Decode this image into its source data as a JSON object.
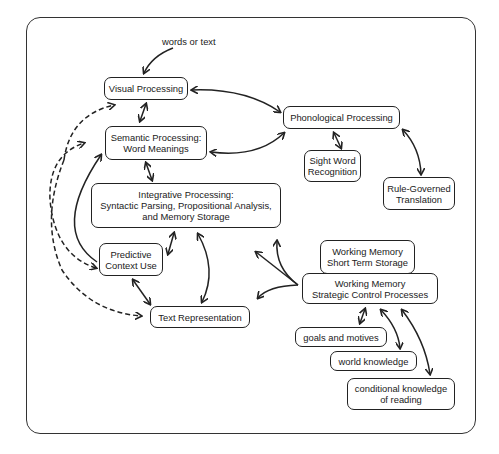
{
  "diagram": {
    "type": "reading-process-model",
    "input_label": "words or text",
    "nodes": {
      "visual": {
        "lines": [
          "Visual Processing"
        ]
      },
      "semantic": {
        "lines": [
          "Semantic Processing:",
          "Word Meanings"
        ]
      },
      "phonological": {
        "lines": [
          "Phonological Processing"
        ]
      },
      "sight_word": {
        "lines": [
          "Sight Word",
          "Recognition"
        ]
      },
      "rule_governed": {
        "lines": [
          "Rule-Governed",
          "Translation"
        ]
      },
      "integrative": {
        "lines": [
          "Integrative Processing:",
          "Syntactic Parsing, Propositional Analysis,",
          "and Memory Storage"
        ]
      },
      "predictive": {
        "lines": [
          "Predictive",
          "Context Use"
        ]
      },
      "text_rep": {
        "lines": [
          "Text Representation"
        ]
      },
      "wm_short": {
        "lines": [
          "Working Memory",
          "Short Term Storage"
        ]
      },
      "wm_strategic": {
        "lines": [
          "Working Memory",
          "Strategic Control Processes"
        ]
      },
      "goals": {
        "lines": [
          "goals and motives"
        ]
      },
      "world": {
        "lines": [
          "world knowledge"
        ]
      },
      "conditional": {
        "lines": [
          "conditional knowledge",
          "of reading"
        ]
      }
    },
    "edges": [
      {
        "from": "input",
        "to": "visual",
        "style": "solid",
        "direction": "one-way"
      },
      {
        "from": "visual",
        "to": "semantic",
        "style": "solid",
        "direction": "two-way"
      },
      {
        "from": "phonological",
        "to": "visual",
        "style": "solid",
        "direction": "two-way"
      },
      {
        "from": "phonological",
        "to": "semantic",
        "style": "solid",
        "direction": "two-way"
      },
      {
        "from": "phonological",
        "to": "sight_word",
        "style": "solid",
        "direction": "two-way"
      },
      {
        "from": "phonological",
        "to": "rule_governed",
        "style": "solid",
        "direction": "two-way"
      },
      {
        "from": "semantic",
        "to": "integrative",
        "style": "solid",
        "direction": "two-way"
      },
      {
        "from": "predictive",
        "to": "semantic",
        "style": "solid",
        "direction": "one-way"
      },
      {
        "from": "predictive",
        "to": "visual",
        "style": "dashed",
        "direction": "one-way"
      },
      {
        "from": "predictive",
        "to": "semantic",
        "style": "dashed",
        "direction": "two-way"
      },
      {
        "from": "text_rep",
        "to": "predictive",
        "style": "dashed",
        "direction": "one-way"
      },
      {
        "from": "integrative",
        "to": "predictive",
        "style": "solid",
        "direction": "two-way"
      },
      {
        "from": "integrative",
        "to": "text_rep",
        "style": "solid",
        "direction": "two-way"
      },
      {
        "from": "predictive",
        "to": "text_rep",
        "style": "solid",
        "direction": "two-way"
      },
      {
        "from": "wm_strategic",
        "to": "integrative",
        "style": "solid",
        "direction": "two-way"
      },
      {
        "from": "wm_strategic",
        "to": "text_rep",
        "style": "solid",
        "direction": "two-way"
      },
      {
        "from": "wm_strategic",
        "to": "goals",
        "style": "solid",
        "direction": "two-way"
      },
      {
        "from": "wm_strategic",
        "to": "world",
        "style": "solid",
        "direction": "two-way"
      },
      {
        "from": "wm_strategic",
        "to": "conditional",
        "style": "solid",
        "direction": "two-way"
      }
    ]
  }
}
